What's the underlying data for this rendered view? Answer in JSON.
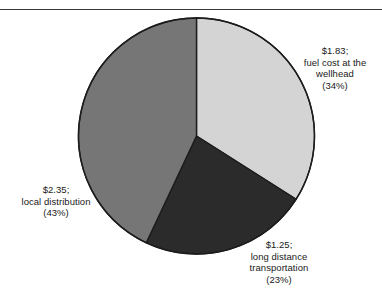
{
  "figure": {
    "background_color": "#ffffff",
    "rule_color": "#3a3a3a",
    "text_color": "#1a1a1a"
  },
  "chart_data": {
    "type": "pie",
    "title": "",
    "subtitle": "",
    "xlabel": "",
    "ylabel": "",
    "legend_position": "none",
    "grid": false,
    "units": "US dollars per thousand cubic feet",
    "start_angle_deg": 0,
    "direction": "clockwise",
    "categories": [
      "fuel cost at the wellhead",
      "long distance transportation",
      "local distribution"
    ],
    "values": [
      1.83,
      1.25,
      2.35
    ],
    "percentages": [
      34,
      23,
      43
    ],
    "colors": [
      "#d4d4d4",
      "#2b2b2b",
      "#767676"
    ],
    "slices": [
      {
        "name": "fuel-cost-wellhead",
        "value": 1.83,
        "value_text": "$1.83;",
        "label": "fuel cost at the",
        "label2": "wellhead",
        "percent": 34,
        "percent_text": "(34%)",
        "color": "#d4d4d4",
        "start_deg": 0,
        "end_deg": 122.4
      },
      {
        "name": "long-distance-transportation",
        "value": 1.25,
        "value_text": "$1.25;",
        "label": "long distance",
        "label2": "transportation",
        "percent": 23,
        "percent_text": "(23%)",
        "color": "#2b2b2b",
        "start_deg": 122.4,
        "end_deg": 205.2
      },
      {
        "name": "local-distribution",
        "value": 2.35,
        "value_text": "$2.35;",
        "label": "local distribution",
        "label2": "",
        "percent": 43,
        "percent_text": "(43%)",
        "color": "#767676",
        "start_deg": 205.2,
        "end_deg": 360
      }
    ],
    "total": 5.43
  },
  "labels": {
    "fuel": {
      "line1": "$1.83;",
      "line2": "fuel cost at the",
      "line3": "wellhead",
      "line4": "(34%)"
    },
    "local": {
      "line1": "$2.35;",
      "line2": "local distribution",
      "line3": "(43%)"
    },
    "longdist": {
      "line1": "$1.25;",
      "line2": "long distance",
      "line3": "transportation",
      "line4": "(23%)"
    }
  }
}
